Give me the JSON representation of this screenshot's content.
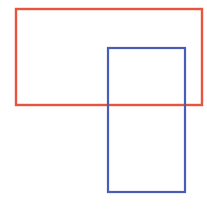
{
  "canvas": {
    "width": 207,
    "height": 212,
    "background": "#ffffff"
  },
  "shapes": [
    {
      "id": "red-rectangle",
      "type": "rect",
      "x": 16,
      "y": 9,
      "width": 186,
      "height": 96,
      "stroke": "#e8553f",
      "stroke_width": 2.4,
      "fill": "none"
    },
    {
      "id": "blue-rectangle",
      "type": "rect",
      "x": 108,
      "y": 48,
      "width": 77,
      "height": 144,
      "stroke": "#4a5db4",
      "stroke_width": 2.2,
      "fill": "none"
    }
  ]
}
